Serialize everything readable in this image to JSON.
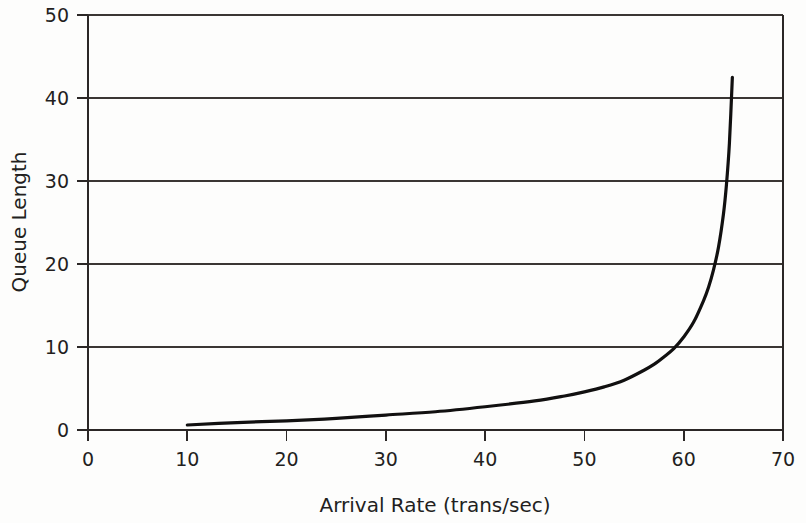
{
  "chart_data": {
    "type": "line",
    "title": "",
    "xlabel": "Arrival Rate (trans/sec)",
    "ylabel": "Queue Length",
    "xlim": [
      0,
      70
    ],
    "ylim": [
      0,
      50
    ],
    "xticks": [
      0,
      10,
      20,
      30,
      40,
      50,
      60,
      70
    ],
    "yticks": [
      0,
      10,
      20,
      30,
      40,
      50
    ],
    "xtick_labels": [
      "0",
      "10",
      "20",
      "30",
      "40",
      "50",
      "60",
      "70"
    ],
    "ytick_labels": [
      "0",
      "10",
      "20",
      "30",
      "40",
      "50"
    ],
    "grid": "horizontal",
    "legend": "none",
    "line_color": "#111010",
    "grid_color": "#3a3634",
    "background_color": "#fdfdfc",
    "series": [
      {
        "name": "Queue Length",
        "x": [
          10,
          15,
          20,
          25,
          30,
          35,
          40,
          45,
          48,
          50,
          52,
          54,
          56,
          57,
          58,
          59,
          60,
          61,
          62,
          62.5,
          63,
          63.5,
          64,
          64.3,
          64.6,
          64.9
        ],
        "y": [
          0.6,
          0.9,
          1.1,
          1.4,
          1.8,
          2.2,
          2.8,
          3.5,
          4.1,
          4.6,
          5.2,
          6.0,
          7.2,
          7.9,
          8.8,
          9.8,
          11.2,
          13.0,
          15.6,
          17.2,
          19.3,
          22.0,
          26.0,
          29.5,
          34.5,
          42.5
        ]
      }
    ],
    "annotations": [
      {
        "text": "curve asymptotically approaches saturation near arrival rate 65",
        "x": 65,
        "y": 42.5
      }
    ]
  },
  "axis": {
    "x_title": "Arrival Rate (trans/sec)",
    "y_title": "Queue Length"
  }
}
